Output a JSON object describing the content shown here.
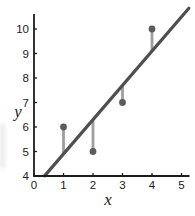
{
  "chart_data": {
    "type": "scatter",
    "title": "",
    "xlabel": "x",
    "ylabel": "y",
    "xlim": [
      0,
      5
    ],
    "ylim": [
      4,
      10
    ],
    "x_ticks": [
      "0",
      "1",
      "2",
      "3",
      "4",
      "5"
    ],
    "y_ticks": [
      "4",
      "5",
      "6",
      "7",
      "8",
      "9",
      "10"
    ],
    "grid": false,
    "legend": "none",
    "points": [
      {
        "x": 1,
        "y": 6
      },
      {
        "x": 2,
        "y": 5
      },
      {
        "x": 3,
        "y": 7
      },
      {
        "x": 4,
        "y": 10
      }
    ],
    "fit_line": {
      "slope": 1.4,
      "intercept": 3.5,
      "x_start": 0.36,
      "x_end": 5.25
    },
    "residuals": [
      {
        "x": 1,
        "y_point": 6,
        "y_line": 4.9
      },
      {
        "x": 2,
        "y_point": 5,
        "y_line": 6.3
      },
      {
        "x": 3,
        "y_point": 7,
        "y_line": 7.7
      },
      {
        "x": 4,
        "y_point": 10,
        "y_line": 9.1
      }
    ],
    "colors": {
      "axis": "#1c1c1c",
      "fit_line": "#4f4f4f",
      "residual": "#9e9e9e",
      "point": "#5c5c5c",
      "tick_label": "#1c1c1c"
    }
  }
}
